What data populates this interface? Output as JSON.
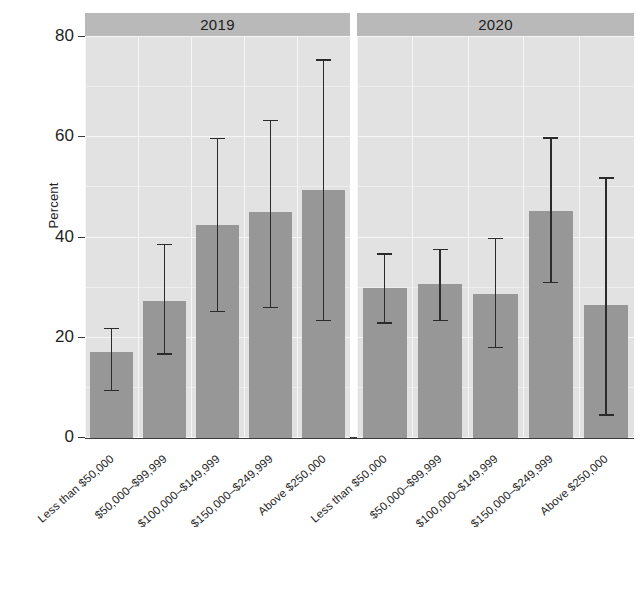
{
  "chart_data": {
    "type": "bar",
    "title": "",
    "xlabel": "",
    "ylabel": "Percent",
    "ylim": [
      0,
      80
    ],
    "yticks": [
      0,
      20,
      40,
      60,
      80
    ],
    "ytick_labels": [
      "0",
      "20",
      "40",
      "60",
      "80"
    ],
    "grid": true,
    "legend": null,
    "facet_labels": [
      "2019",
      "2020"
    ],
    "categories": [
      "Less than $50,000",
      "$50,000–$99,999",
      "$100,000–$149,999",
      "$150,000–$249,999",
      "Above $250,000"
    ],
    "panels": [
      {
        "label": "2019",
        "values": [
          17.2,
          27.3,
          42.5,
          45.0,
          49.4
        ],
        "error_low": [
          9.4,
          16.7,
          25.2,
          26.0,
          23.4
        ],
        "error_high": [
          21.8,
          38.6,
          59.7,
          63.3,
          75.4
        ]
      },
      {
        "label": "2020",
        "values": [
          30.0,
          30.7,
          28.7,
          45.3,
          26.5
        ],
        "error_low": [
          22.9,
          23.4,
          18.0,
          31.0,
          4.6
        ],
        "error_high": [
          36.7,
          37.6,
          39.8,
          59.8,
          51.8
        ]
      }
    ],
    "colors": {
      "bar": "#979797",
      "errorbar": "#2b2b2b",
      "panel_strip": "#b9b9b9",
      "plot_background": "#e2e2e2",
      "gridline": "#f6f6f6",
      "axis": "#3a3a3a",
      "text": "#1f1f1f",
      "page_background": "#ffffff"
    }
  }
}
